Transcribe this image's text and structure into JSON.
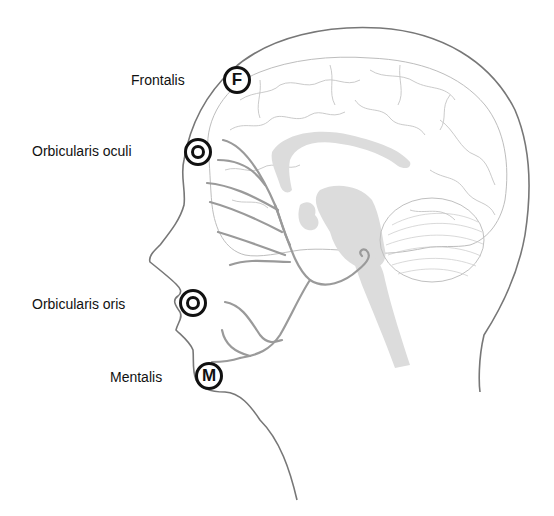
{
  "diagram": {
    "type": "anatomical-illustration",
    "colors": {
      "outline": "#777777",
      "brain_outline": "#b8b8b8",
      "nerve": "#999999",
      "brain_structure_fill": "#dcdcdc",
      "label_text": "#111111",
      "marker": "#111111"
    },
    "labels": [
      {
        "id": "frontalis",
        "text": "Frontalis",
        "marker_letter": "F",
        "marker_style": "letter"
      },
      {
        "id": "orbicularis-oculi",
        "text": "Orbicularis oculi",
        "marker_letter": "O",
        "marker_style": "ring"
      },
      {
        "id": "orbicularis-oris",
        "text": "Orbicularis oris",
        "marker_letter": "O",
        "marker_style": "ring"
      },
      {
        "id": "mentalis",
        "text": "Mentalis",
        "marker_letter": "M",
        "marker_style": "letter"
      }
    ]
  }
}
